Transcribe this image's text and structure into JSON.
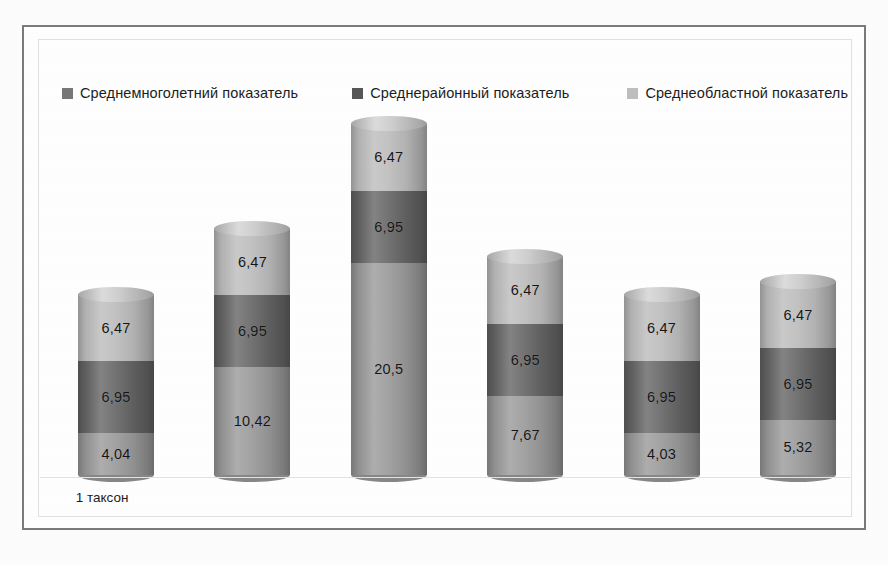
{
  "chart_data": {
    "type": "bar",
    "subtype": "stacked-cylinder",
    "title": "",
    "subtitle": "",
    "xlabel": "",
    "ylabel": "",
    "grid": false,
    "legend_position": "top",
    "categories": [
      "1 таксон",
      "",
      "",
      "",
      "",
      ""
    ],
    "visible_category_labels": [
      "1 таксон"
    ],
    "series": [
      {
        "name": "Среднемноголетний показатель",
        "color": "#9a9a9a",
        "values": [
          4.04,
          10.42,
          20.5,
          7.67,
          4.03,
          5.32
        ],
        "labels": [
          "4,04",
          "10,42",
          "20,5",
          "7,67",
          "4,03",
          "5,32"
        ]
      },
      {
        "name": "Среднерайонный показатель",
        "color": "#656565",
        "values": [
          6.95,
          6.95,
          6.95,
          6.95,
          6.95,
          6.95
        ],
        "labels": [
          "6,95",
          "6,95",
          "6,95",
          "6,95",
          "6,95",
          "6,95"
        ]
      },
      {
        "name": "Среднеобластной показатель",
        "color": "#bdbdbd",
        "values": [
          6.47,
          6.47,
          6.47,
          6.47,
          6.47,
          6.47
        ],
        "labels": [
          "6,47",
          "6,47",
          "6,47",
          "6,47",
          "6,47",
          "6,47"
        ]
      }
    ],
    "stack_totals": [
      17.46,
      23.84,
      33.92,
      21.09,
      17.45,
      18.74
    ],
    "ylim": [
      0,
      34
    ]
  },
  "legend": {
    "items": [
      {
        "label": "Среднемноголетний показатель",
        "swatch_color": "#787878",
        "marker": "square-marker"
      },
      {
        "label": "Среднерайонный показатель",
        "swatch_color": "#575757",
        "marker": "square-marker"
      },
      {
        "label": "Среднеобластной показатель",
        "swatch_color": "#bfbfbf",
        "marker": "square-marker"
      }
    ]
  },
  "axis": {
    "category_label": "1 таксон"
  },
  "colors": {
    "series_bottom": "#9a9a9a",
    "series_middle": "#656565",
    "series_top": "#bdbdbd",
    "frame_border": "#7b7b7b",
    "plot_border": "#e2e2e2",
    "label_text": "#151515",
    "background": "#ffffff"
  }
}
